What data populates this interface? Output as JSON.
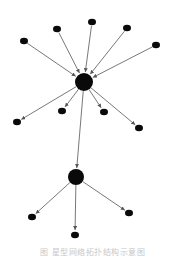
{
  "diagram": {
    "type": "directed-graph",
    "colors": {
      "node": "#0a0a0a",
      "edge": "#555555",
      "background": "#ffffff",
      "caption": "#c8c8c8"
    },
    "nodes": [
      {
        "id": "hub1",
        "x": 84,
        "y": 82,
        "r": 9
      },
      {
        "id": "hub2",
        "x": 76,
        "y": 177,
        "r": 8
      },
      {
        "id": "in1",
        "x": 24,
        "y": 41,
        "r": 4
      },
      {
        "id": "in2",
        "x": 57,
        "y": 29,
        "r": 4
      },
      {
        "id": "in3",
        "x": 92,
        "y": 22,
        "r": 4
      },
      {
        "id": "in4",
        "x": 127,
        "y": 28,
        "r": 4
      },
      {
        "id": "in5",
        "x": 156,
        "y": 45,
        "r": 4
      },
      {
        "id": "out1",
        "x": 17,
        "y": 122,
        "r": 4
      },
      {
        "id": "out2",
        "x": 62,
        "y": 111,
        "r": 4
      },
      {
        "id": "out3",
        "x": 104,
        "y": 112,
        "r": 4
      },
      {
        "id": "out4",
        "x": 139,
        "y": 128,
        "r": 4
      },
      {
        "id": "leaf1",
        "x": 32,
        "y": 217,
        "r": 4
      },
      {
        "id": "leaf2",
        "x": 75,
        "y": 235,
        "r": 4
      },
      {
        "id": "leaf3",
        "x": 129,
        "y": 213,
        "r": 4
      }
    ],
    "edges": [
      {
        "from": "in1",
        "to": "hub1"
      },
      {
        "from": "in2",
        "to": "hub1"
      },
      {
        "from": "in3",
        "to": "hub1"
      },
      {
        "from": "in4",
        "to": "hub1"
      },
      {
        "from": "in5",
        "to": "hub1"
      },
      {
        "from": "hub1",
        "to": "out1"
      },
      {
        "from": "hub1",
        "to": "out2"
      },
      {
        "from": "hub1",
        "to": "out3"
      },
      {
        "from": "hub1",
        "to": "out4"
      },
      {
        "from": "hub1",
        "to": "hub2"
      },
      {
        "from": "hub2",
        "to": "leaf1"
      },
      {
        "from": "hub2",
        "to": "leaf2"
      },
      {
        "from": "hub2",
        "to": "leaf3"
      }
    ]
  },
  "caption": "图 星型网络拓扑结构示意图"
}
